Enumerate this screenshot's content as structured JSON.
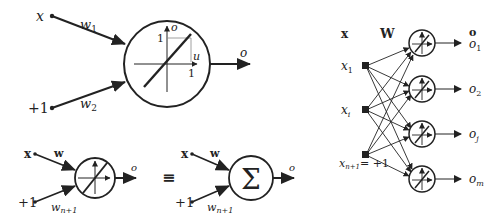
{
  "single_neuron": {
    "input_x": "x",
    "input_bias": "+1",
    "weight_1": "w",
    "weight_1_sub": "1",
    "weight_2": "w",
    "weight_2_sub": "2",
    "axis_o": "o",
    "axis_u": "u",
    "tick_y": "1",
    "tick_x": "1",
    "output": "o"
  },
  "compact_neuron": {
    "input_x": "x",
    "weight": "w",
    "input_bias": "+1",
    "bias_weight": "w",
    "bias_weight_sub": "n+1",
    "output": "o"
  },
  "equivalence": "≡",
  "sum_neuron": {
    "input_x": "x",
    "weight": "w",
    "input_bias": "+1",
    "bias_weight": "w",
    "bias_weight_sub": "n+1",
    "symbol": "Σ",
    "output": "o"
  },
  "network": {
    "input_header": "x",
    "weight_header": "W",
    "output_header": "o",
    "inputs": [
      {
        "label": "x",
        "sub": "1",
        "suffix": ""
      },
      {
        "label": "x",
        "sub": "i",
        "suffix": ""
      },
      {
        "label": "x",
        "sub": "n+1",
        "suffix": "= +1"
      }
    ],
    "outputs": [
      {
        "label": "o",
        "sub": "1"
      },
      {
        "label": "o",
        "sub": "2"
      },
      {
        "label": "o",
        "sub": "j"
      },
      {
        "label": "o",
        "sub": "m"
      }
    ]
  },
  "colors": {
    "stroke": "#222222",
    "background": "#ffffff"
  }
}
